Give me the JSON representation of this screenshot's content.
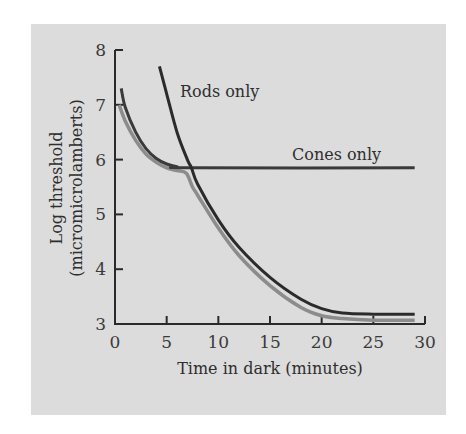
{
  "chart_data": {
    "type": "line",
    "title": "",
    "xlabel": "Time in dark (minutes)",
    "ylabel": "Log threshold",
    "ylabel_units": "(micromicrolamberts)",
    "xlim": [
      0,
      30
    ],
    "ylim": [
      3,
      8
    ],
    "x_ticks": [
      "0",
      "5",
      "10",
      "15",
      "20",
      "25",
      "30"
    ],
    "y_ticks": [
      "3",
      "4",
      "5",
      "6",
      "7",
      "8"
    ],
    "grid": false,
    "legend": "inline annotations",
    "annotations": [
      "Rods only",
      "Cones only"
    ],
    "series": [
      {
        "name": "Rods only",
        "color": "#2b2b2b",
        "points": [
          [
            4.3,
            7.7
          ],
          [
            5,
            7.2
          ],
          [
            6,
            6.5
          ],
          [
            7,
            6.0
          ],
          [
            7.4,
            5.85
          ],
          [
            8,
            5.55
          ],
          [
            10,
            4.9
          ],
          [
            12,
            4.4
          ],
          [
            15,
            3.85
          ],
          [
            18,
            3.45
          ],
          [
            20,
            3.28
          ],
          [
            22,
            3.2
          ],
          [
            25,
            3.18
          ],
          [
            29,
            3.18
          ]
        ]
      },
      {
        "name": "Cones only",
        "color": "#3a3a3a",
        "points": [
          [
            0.6,
            7.3
          ],
          [
            1,
            6.95
          ],
          [
            2,
            6.5
          ],
          [
            3,
            6.2
          ],
          [
            4,
            6.02
          ],
          [
            5,
            5.92
          ],
          [
            6,
            5.87
          ],
          [
            7.4,
            5.85
          ],
          [
            29,
            5.85
          ]
        ]
      },
      {
        "name": "Combined threshold",
        "color": "#8c8c8c",
        "points": [
          [
            0.4,
            7.0
          ],
          [
            1,
            6.7
          ],
          [
            2,
            6.35
          ],
          [
            3,
            6.1
          ],
          [
            4,
            5.95
          ],
          [
            5,
            5.85
          ],
          [
            6,
            5.8
          ],
          [
            6.9,
            5.75
          ],
          [
            7.5,
            5.5
          ],
          [
            8,
            5.35
          ],
          [
            10,
            4.75
          ],
          [
            12,
            4.25
          ],
          [
            15,
            3.7
          ],
          [
            18,
            3.3
          ],
          [
            20,
            3.15
          ],
          [
            22,
            3.1
          ],
          [
            25,
            3.07
          ],
          [
            29,
            3.07
          ]
        ]
      }
    ]
  },
  "labels": {
    "rods": "Rods only",
    "cones": "Cones only",
    "xlabel": "Time in dark (minutes)",
    "ylabel_line1": "Log threshold",
    "ylabel_line2": "(micromicrolamberts)"
  }
}
